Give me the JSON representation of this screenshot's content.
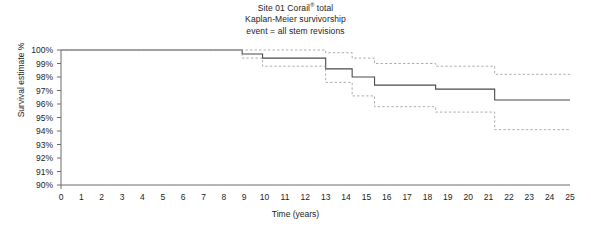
{
  "title": {
    "line1_pre": "Site 01 Corail",
    "line1_mark": "®",
    "line1_post": " total",
    "line2": "Kaplan-Meier survivorship",
    "line3": "event = all stem revisions"
  },
  "axes": {
    "ylabel": "Survival estimate %",
    "xlabel": "Time (years)"
  },
  "chart_data": {
    "type": "line",
    "title": "Site 01 Corail® total Kaplan-Meier survivorship event = all stem revisions",
    "xlabel": "Time (years)",
    "ylabel": "Survival estimate %",
    "xlim": [
      0,
      25
    ],
    "ylim": [
      90,
      100
    ],
    "grid": false,
    "legend": false,
    "step_style": "post",
    "xticks": [
      0,
      1,
      2,
      3,
      4,
      5,
      6,
      7,
      8,
      9,
      10,
      11,
      12,
      13,
      14,
      15,
      16,
      17,
      18,
      19,
      20,
      21,
      22,
      23,
      24,
      25
    ],
    "xtick_labels": [
      "0",
      "1",
      "2",
      "3",
      "4",
      "5",
      "6",
      "7",
      "8",
      "9",
      "10",
      "11",
      "12",
      "13",
      "14",
      "15",
      "16",
      "17",
      "18",
      "19",
      "20",
      "21",
      "22",
      "23",
      "24",
      "25"
    ],
    "yticks": [
      90,
      91,
      92,
      93,
      94,
      95,
      96,
      97,
      98,
      99,
      100
    ],
    "ytick_labels": [
      "90%",
      "91%",
      "92%",
      "93%",
      "94%",
      "95%",
      "96%",
      "97%",
      "98%",
      "99%",
      "100%"
    ],
    "series": [
      {
        "name": "Kaplan-Meier survival estimate",
        "style": "solid",
        "color": "#4a4a4a",
        "x": [
          0,
          8.9,
          9.9,
          13.0,
          14.3,
          15.4,
          18.4,
          21.3,
          25.0
        ],
        "values": [
          100.0,
          99.7,
          99.4,
          98.6,
          98.0,
          97.4,
          97.1,
          96.3,
          96.3
        ]
      },
      {
        "name": "Upper 95% confidence limit",
        "style": "dashed",
        "color": "#9e9e9e",
        "x": [
          0,
          8.9,
          13.0,
          14.3,
          15.4,
          18.4,
          21.3,
          25.0
        ],
        "values": [
          100.0,
          100.0,
          99.8,
          99.4,
          99.0,
          98.8,
          98.2,
          98.2
        ]
      },
      {
        "name": "Lower 95% confidence limit",
        "style": "dashed",
        "color": "#9e9e9e",
        "x": [
          0,
          8.9,
          9.9,
          13.0,
          14.3,
          15.4,
          18.4,
          21.3,
          25.0
        ],
        "values": [
          100.0,
          99.4,
          98.8,
          97.6,
          96.6,
          95.8,
          95.4,
          94.1,
          94.1
        ]
      }
    ]
  }
}
